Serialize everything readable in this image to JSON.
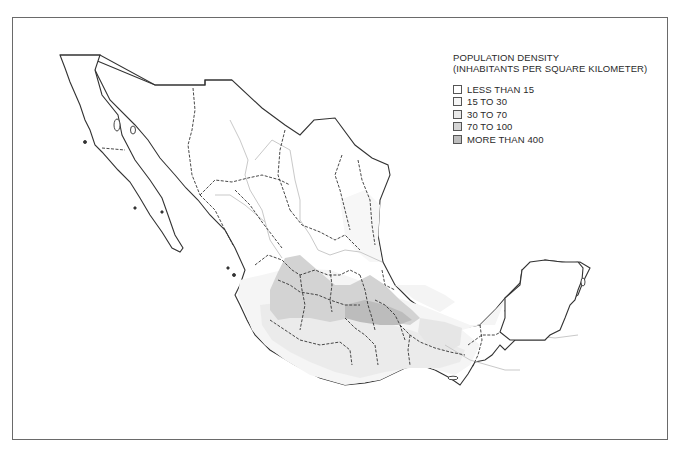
{
  "map": {
    "subject": "Mexico",
    "legend": {
      "title_line1": "POPULATION DENSITY",
      "title_line2": "(INHABITANTS PER SQUARE KILOMETER)",
      "items": [
        {
          "label": "LESS THAN 15",
          "color": "#ffffff"
        },
        {
          "label": "15 TO 30",
          "color": "#f6f6f6"
        },
        {
          "label": "30 TO 70",
          "color": "#e9e9e9"
        },
        {
          "label": "70 TO 100",
          "color": "#d4d4d4"
        },
        {
          "label": "MORE THAN 400",
          "color": "#bdbdbd"
        }
      ]
    },
    "colors": {
      "frame": "#6a6a6a",
      "coastline": "#333333",
      "state_border": "#333333",
      "zone_border": "#c8c8c8",
      "background": "#ffffff"
    }
  }
}
